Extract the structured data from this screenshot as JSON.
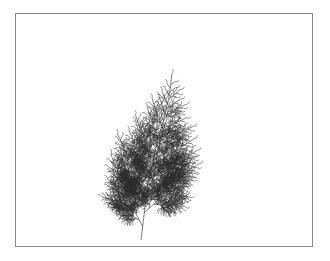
{
  "figure": {
    "frame_color": "#8a8a8a",
    "stroke_color": "#2a2a2a",
    "background": "#ffffff"
  }
}
